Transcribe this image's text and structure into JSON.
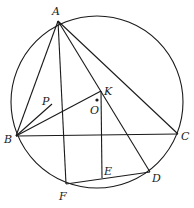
{
  "diagram": {
    "type": "geometry",
    "circle": {
      "center": "O",
      "cx": 97,
      "cy": 102,
      "r": 86
    },
    "points": {
      "A": {
        "x": 58,
        "y": 21,
        "label": "A",
        "lx": 52,
        "ly": 15
      },
      "B": {
        "x": 16,
        "y": 136,
        "label": "B",
        "lx": 4,
        "ly": 143
      },
      "C": {
        "x": 178,
        "y": 134,
        "label": "C",
        "lx": 181,
        "ly": 140
      },
      "K": {
        "x": 101,
        "y": 91,
        "label": "K",
        "lx": 104,
        "ly": 95
      },
      "O": {
        "x": 97,
        "y": 100,
        "label": "O",
        "lx": 90,
        "ly": 114
      },
      "P": {
        "x": 52,
        "y": 104,
        "label": "P",
        "lx": 42,
        "ly": 105
      },
      "F": {
        "x": 66,
        "y": 184,
        "label": "F",
        "lx": 59,
        "ly": 200
      },
      "E": {
        "x": 102,
        "y": 178,
        "label": "E",
        "lx": 104,
        "ly": 175
      },
      "D": {
        "x": 150,
        "y": 172,
        "label": "D",
        "lx": 152,
        "ly": 182
      }
    },
    "segments": [
      [
        "A",
        "B"
      ],
      [
        "A",
        "C"
      ],
      [
        "B",
        "C"
      ],
      [
        "A",
        "F"
      ],
      [
        "A",
        "D"
      ],
      [
        "B",
        "K"
      ],
      [
        "B",
        "P"
      ],
      [
        "K",
        "E"
      ],
      [
        "F",
        "D"
      ]
    ]
  }
}
